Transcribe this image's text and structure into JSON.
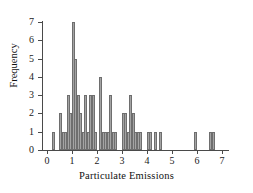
{
  "chart_data": {
    "type": "bar",
    "title": "",
    "subtitle": "",
    "xlabel": "Particulate Emissions",
    "ylabel": "Frequency",
    "xlim": [
      0,
      7
    ],
    "ylim": [
      0,
      7
    ],
    "grid": false,
    "legend": null,
    "bin_width": 0.1,
    "x_ticks": [
      "0",
      "1",
      "2",
      "3",
      "4",
      "5",
      "6",
      "7"
    ],
    "x_tick_values": [
      0,
      1,
      2,
      3,
      4,
      5,
      6,
      7
    ],
    "y_ticks": [
      "0",
      "1",
      "2",
      "3",
      "4",
      "5",
      "6",
      "7"
    ],
    "y_tick_values": [
      0,
      1,
      2,
      3,
      4,
      5,
      6,
      7
    ],
    "bar_color": "#a3a3a3",
    "bar_edge_color": "#6e6e6e",
    "axis_color": "#4a4a4a",
    "x": [
      0.25,
      0.55,
      0.65,
      0.75,
      0.85,
      0.95,
      1.05,
      1.15,
      1.25,
      1.35,
      1.45,
      1.55,
      1.65,
      1.75,
      1.85,
      1.95,
      2.15,
      2.25,
      2.35,
      2.45,
      2.55,
      2.65,
      2.75,
      3.05,
      3.15,
      3.25,
      3.35,
      3.45,
      3.55,
      3.65,
      3.75,
      4.05,
      4.15,
      4.35,
      4.55,
      5.95,
      6.55,
      6.65
    ],
    "values": [
      1,
      2,
      1,
      1,
      3,
      2,
      7,
      5,
      3,
      2,
      1,
      3,
      1,
      3,
      3,
      1,
      4,
      1,
      1,
      1,
      3,
      1,
      1,
      2,
      2,
      1,
      3,
      2,
      1,
      1,
      1,
      1,
      1,
      1,
      1,
      1,
      1,
      1
    ],
    "series": [
      {
        "name": "Frequency",
        "values": [
          1,
          2,
          1,
          1,
          3,
          2,
          7,
          5,
          3,
          2,
          1,
          3,
          1,
          3,
          3,
          1,
          4,
          1,
          1,
          1,
          3,
          1,
          1,
          2,
          2,
          1,
          3,
          2,
          1,
          1,
          1,
          1,
          1,
          1,
          1,
          1,
          1,
          1
        ]
      }
    ]
  }
}
